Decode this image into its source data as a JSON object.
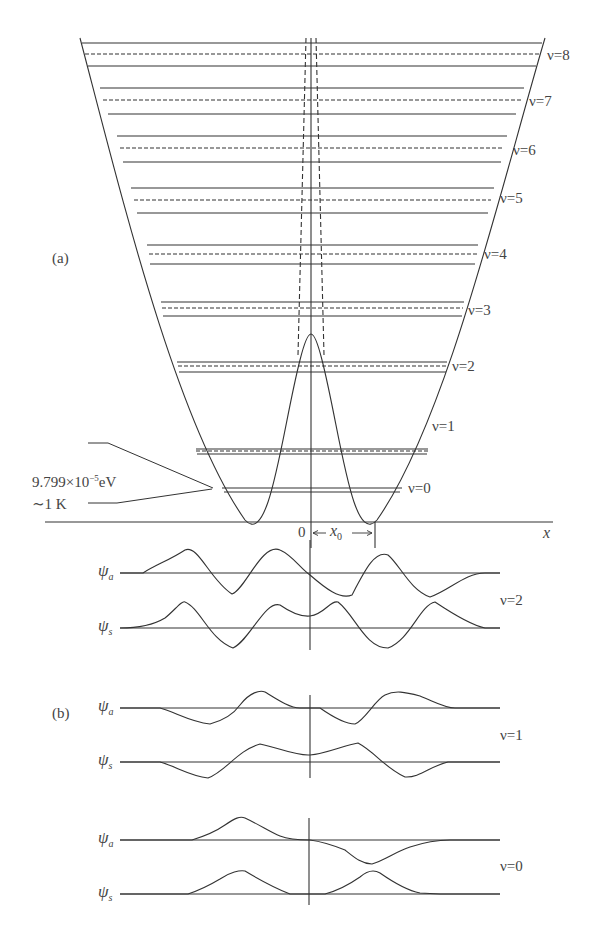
{
  "figure": {
    "part_a_label": "(a)",
    "part_b_label": "(b)",
    "axis_x_label": "x",
    "origin_label": "0",
    "x0_label": "x",
    "x0_sub": "0",
    "annotation": {
      "line1_mantissa": "9.799×10",
      "line1_exp": "−5",
      "line1_unit": "eV",
      "line2": "∼1 K"
    }
  },
  "levels": [
    {
      "nu": "ν=0",
      "y_solid_top": 488,
      "y_dashed": null,
      "y_solid_bottom": 492,
      "label_y": 485,
      "label_x": 407
    },
    {
      "nu": "ν=1",
      "y_solid_top": 449,
      "y_dashed": 451,
      "y_solid_bottom": 454,
      "label_y": 420,
      "label_x": 423
    },
    {
      "nu": "ν=2",
      "y_solid_top": 362,
      "y_dashed": 366,
      "y_solid_bottom": 372,
      "label_y": 358,
      "label_x": 447
    },
    {
      "nu": "ν=3",
      "y_solid_top": 302,
      "y_dashed": 308,
      "y_solid_bottom": 316,
      "label_y": 303,
      "label_x": 464
    },
    {
      "nu": "ν=4",
      "y_solid_top": 245,
      "y_dashed": 254,
      "y_solid_bottom": 264,
      "label_y": 245,
      "label_x": 480
    },
    {
      "nu": "ν=5",
      "y_solid_top": 188,
      "y_dashed": 200,
      "y_solid_bottom": 213,
      "label_y": 190,
      "label_x": 494
    },
    {
      "nu": "ν=6",
      "y_solid_top": 136,
      "y_dashed": 148,
      "y_solid_bottom": 162,
      "label_y": 141,
      "label_x": 507
    },
    {
      "nu": "ν=7",
      "y_solid_top": 88,
      "y_dashed": 100,
      "y_solid_bottom": 114,
      "label_y": 91,
      "label_x": 522
    },
    {
      "nu": "ν=8",
      "y_solid_top": 43,
      "y_dashed": 54,
      "y_solid_bottom": 66,
      "label_y": 45,
      "label_x": 537
    }
  ],
  "wavefunctions": [
    {
      "group": "ν=2",
      "psi_a": "ψ",
      "psi_a_sub": "a",
      "psi_s": "ψ",
      "psi_s_sub": "s",
      "nu_label": "ν=2"
    },
    {
      "group": "ν=1",
      "psi_a": "ψ",
      "psi_a_sub": "a",
      "psi_s": "ψ",
      "psi_s_sub": "s",
      "nu_label": "ν=1"
    },
    {
      "group": "ν=0",
      "psi_a": "ψ",
      "psi_a_sub": "a",
      "psi_s": "ψ",
      "psi_s_sub": "s",
      "nu_label": "ν=0"
    }
  ],
  "colors": {
    "line": "#333333",
    "text": "#444444",
    "background": "#ffffff"
  }
}
